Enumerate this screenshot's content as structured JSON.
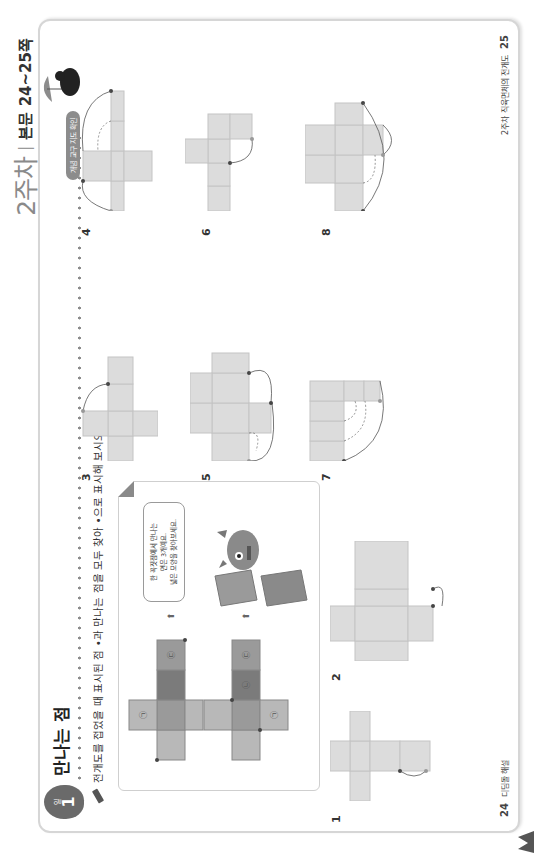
{
  "header": {
    "week_label": "2주차",
    "separator": "|",
    "pages_label": "본문 24~25쪽",
    "level_pill": "개념 교구 지도 확인"
  },
  "lesson": {
    "day_number": "1",
    "day_unit": "일",
    "title": "만나는 점",
    "instruction": "전개도를 접었을 때 표시된 점 •과 만나는 점을 모두 찾아 •으로 표시해 보시오."
  },
  "example": {
    "speech_bubble": [
      "한 꼭짓점에서 만나는",
      "면은 3개예요.",
      "넓은 모양을 찾아보세요."
    ],
    "arrow_glyph": "⬆",
    "face_marks": [
      "㉠",
      "㉡",
      "㉢"
    ]
  },
  "problems": [
    {
      "number": "1"
    },
    {
      "number": "2"
    },
    {
      "number": "3"
    },
    {
      "number": "4"
    },
    {
      "number": "5"
    },
    {
      "number": "6"
    },
    {
      "number": "7"
    },
    {
      "number": "8"
    }
  ],
  "footer": {
    "left_page": "24",
    "left_text": "디딤돌 해설",
    "right_text": "2주차 직육면체의 전개도",
    "right_page": "25"
  },
  "colors": {
    "net_fill": "#dcdcdc",
    "net_stroke": "#c4c4c4",
    "dot": "#444444",
    "badge": "#6a6a6a",
    "face_dark": "#7b7b7b",
    "face_mid": "#9a9a9a",
    "face_light": "#b8b8b8"
  }
}
